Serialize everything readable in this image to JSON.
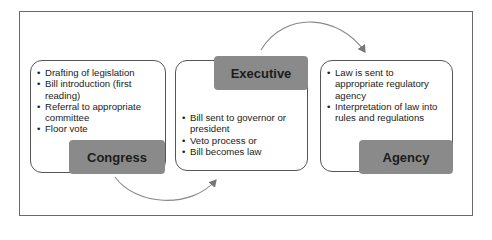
{
  "diagram": {
    "type": "process-flow",
    "stages": [
      {
        "name": "Congress",
        "bullets": [
          "Drafting of legislation",
          "Bill introduction (first reading)",
          "Referral to appropriate committee",
          "Floor vote"
        ]
      },
      {
        "name": "Executive",
        "bullets": [
          "Bill sent to governor or president",
          "Veto process or",
          "Bill becomes law"
        ]
      },
      {
        "name": "Agency",
        "bullets": [
          "Law is sent to appropriate regulatory agency",
          "Interpretation of law into rules and regulations"
        ]
      }
    ],
    "connectors": [
      {
        "from": "Congress",
        "to": "Executive",
        "style": "curved-arrow-below"
      },
      {
        "from": "Executive",
        "to": "Agency",
        "style": "curved-arrow-above"
      }
    ],
    "colors": {
      "label_fill": "#8a8a8a",
      "box_border": "#555555",
      "arrow": "#777777",
      "frame_border": "#6a6a6a"
    }
  }
}
